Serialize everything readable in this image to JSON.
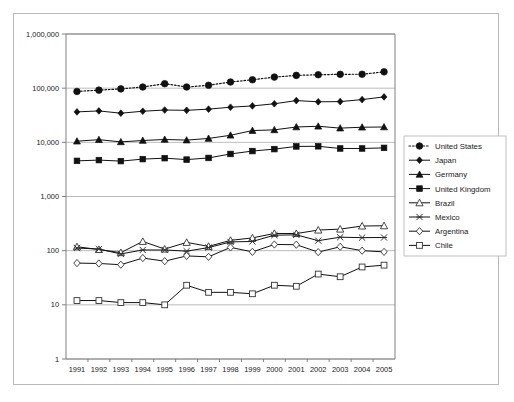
{
  "chart": {
    "type": "line",
    "title": "",
    "xlabel": "",
    "ylabel": "",
    "yscale": "log",
    "grid": "horizontal",
    "legend_position": "right",
    "y_tick_labels": [
      "1,000,000",
      "100,000",
      "10,000",
      "1,000",
      "100",
      "10",
      "1"
    ],
    "x_tick_labels": [
      "1991",
      "1992",
      "1993",
      "1994",
      "1995",
      "1996",
      "1997",
      "1998",
      "1999",
      "2000",
      "2001",
      "2002",
      "2003",
      "2004",
      "2005"
    ]
  },
  "chart_data": {
    "type": "line",
    "title": "",
    "xlabel": "",
    "ylabel": "",
    "yscale": "log",
    "ylim": [
      1,
      1000000
    ],
    "grid": true,
    "legend_position": "right",
    "x": [
      1991,
      1992,
      1993,
      1994,
      1995,
      1996,
      1997,
      1998,
      1999,
      2000,
      2001,
      2002,
      2003,
      2004,
      2005
    ],
    "categories": [
      "1991",
      "1992",
      "1993",
      "1994",
      "1995",
      "1996",
      "1997",
      "1998",
      "1999",
      "2000",
      "2001",
      "2002",
      "2003",
      "2004",
      "2005"
    ],
    "yticks": [
      1,
      10,
      100,
      1000,
      10000,
      100000,
      1000000
    ],
    "ytick_labels": [
      "1",
      "10",
      "100",
      "1,000",
      "10,000",
      "100,000",
      "1,000,000"
    ],
    "series": [
      {
        "name": "United States",
        "marker": "circle-filled",
        "linestyle": "dotted",
        "values": [
          87000,
          92000,
          97000,
          105000,
          121000,
          105000,
          113000,
          130000,
          143000,
          160000,
          172000,
          177000,
          180000,
          181000,
          200000
        ]
      },
      {
        "name": "Japan",
        "marker": "diamond-filled",
        "linestyle": "solid",
        "values": [
          36500,
          38000,
          34500,
          37500,
          39500,
          39000,
          41000,
          44500,
          47000,
          51500,
          59000,
          56000,
          56500,
          61500,
          69000
        ]
      },
      {
        "name": "Germany",
        "marker": "triangle-filled",
        "linestyle": "solid",
        "values": [
          10500,
          11200,
          10200,
          10800,
          11300,
          11000,
          11800,
          13500,
          16500,
          17000,
          19200,
          19800,
          18300,
          19000,
          19200
        ]
      },
      {
        "name": "United Kingdom",
        "marker": "square-filled",
        "linestyle": "solid",
        "values": [
          4550,
          4700,
          4500,
          4900,
          5100,
          4800,
          5150,
          6100,
          6900,
          7500,
          8400,
          8450,
          7700,
          7700,
          7900
        ]
      },
      {
        "name": "Brazil",
        "marker": "triangle-open",
        "linestyle": "solid",
        "values": [
          118,
          105,
          92,
          148,
          107,
          142,
          120,
          155,
          172,
          208,
          207,
          240,
          250,
          285,
          288
        ]
      },
      {
        "name": "Mexico",
        "marker": "cross-open",
        "linestyle": "solid",
        "values": [
          112,
          107,
          87,
          103,
          103,
          98,
          114,
          145,
          148,
          193,
          196,
          153,
          177,
          174,
          175
        ]
      },
      {
        "name": "Argentina",
        "marker": "diamond-open",
        "linestyle": "solid",
        "values": [
          59,
          58,
          55,
          73,
          64,
          80,
          77,
          115,
          95,
          130,
          129,
          94,
          118,
          100,
          95
        ]
      },
      {
        "name": "Chile",
        "marker": "square-open",
        "linestyle": "solid",
        "values": [
          12,
          12,
          11,
          11,
          10,
          23,
          17,
          17,
          16,
          23,
          22,
          37,
          33,
          50,
          54
        ]
      }
    ]
  },
  "legend": {
    "items": [
      {
        "label": "United States"
      },
      {
        "label": "Japan"
      },
      {
        "label": "Germany"
      },
      {
        "label": "United Kingdom"
      },
      {
        "label": "Brazil"
      },
      {
        "label": "Mexico"
      },
      {
        "label": "Argentina"
      },
      {
        "label": "Chile"
      }
    ]
  }
}
